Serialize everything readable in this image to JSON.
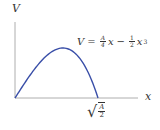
{
  "diagram": {
    "y_axis_label": "V",
    "x_axis_label": "x",
    "equation": {
      "lhs": "V",
      "equals": "=",
      "term1_num": "A",
      "term1_den": "4",
      "term1_var": "x",
      "minus": "−",
      "term2_num": "1",
      "term2_den": "2",
      "term2_var": "x",
      "term2_exp": "3"
    },
    "root_label": {
      "sqrt_symbol": "√",
      "num": "A",
      "den": "2"
    },
    "colors": {
      "curve": "#3a4fa8",
      "axes": "#999999",
      "text": "#333333"
    }
  }
}
